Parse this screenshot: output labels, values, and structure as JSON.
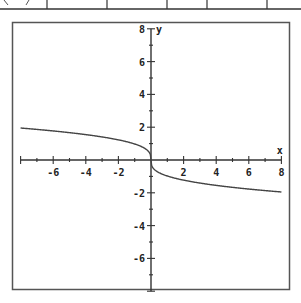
{
  "chart_data": {
    "type": "line",
    "title": "",
    "xlabel": "x",
    "ylabel": "y",
    "xlim": [
      -8,
      8
    ],
    "ylim": [
      -8,
      8
    ],
    "grid": false,
    "legend": null,
    "x_ticks": [
      -6,
      -4,
      -2,
      2,
      4,
      6,
      8
    ],
    "y_ticks": [
      8,
      6,
      4,
      2,
      -2,
      -4,
      -6
    ],
    "minor_tick_step": 1,
    "series": [
      {
        "name": "y = -∛x",
        "x": [
          -8,
          -7,
          -6,
          -5,
          -4,
          -3,
          -2,
          -1,
          -0.5,
          -0.125,
          0,
          0.125,
          0.5,
          1,
          2,
          3,
          4,
          5,
          6,
          7,
          8
        ],
        "values": [
          1.95,
          1.87,
          1.77,
          1.67,
          1.55,
          1.41,
          1.23,
          0.98,
          0.77,
          0.49,
          0,
          -0.49,
          -0.77,
          -0.98,
          -1.23,
          -1.41,
          -1.55,
          -1.67,
          -1.77,
          -1.87,
          -1.95
        ]
      }
    ],
    "annotations": []
  },
  "colors": {
    "axis": "#333333",
    "curve": "#444444",
    "frame": "#555555",
    "background": "#ffffff"
  },
  "axis_labels": {
    "x": "x",
    "y": "y"
  }
}
